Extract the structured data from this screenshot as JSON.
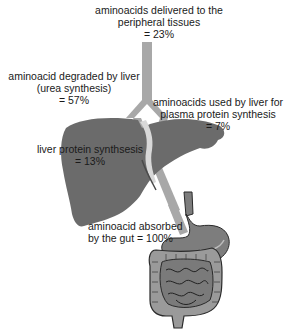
{
  "diagram": {
    "type": "flow-illustration",
    "labels": {
      "peripheral": {
        "lines": [
          "aminoacids delivered to the",
          "peripheral tissues",
          "= 23%"
        ],
        "percent": 23
      },
      "degraded": {
        "lines": [
          "aminoacid degraded by liver",
          "(urea synthesis)",
          "= 57%"
        ],
        "percent": 57
      },
      "plasma": {
        "lines": [
          "aminoacids used by liver for",
          "plasma protein synthesis",
          "= 7%"
        ],
        "percent": 7
      },
      "liver_protein": {
        "lines": [
          "liver protein synthsesis",
          "= 13%"
        ],
        "percent": 13
      },
      "absorbed": {
        "lines": [
          "aminoacid absorbed",
          "by the gut = 100%"
        ],
        "percent": 100
      }
    },
    "organs": [
      "liver",
      "stomach",
      "intestines"
    ],
    "colors": {
      "vessel": "#a8a8a8",
      "vessel_edge": "#8a8a8a",
      "liver": "#6b6b6b",
      "stomach": "#7d7d7d",
      "intestine": "#8c8c8c",
      "intestine_outline": "#2a2a2a",
      "text": "#1a1a1a",
      "background": "#ffffff"
    }
  }
}
